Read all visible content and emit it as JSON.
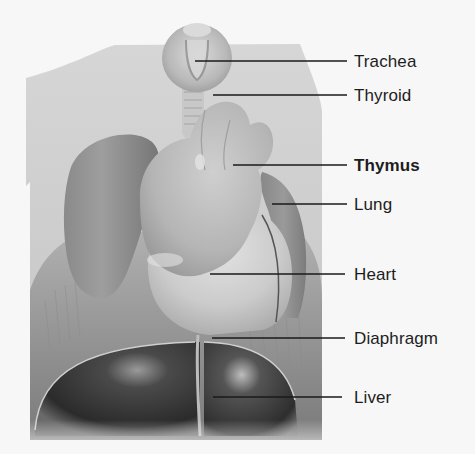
{
  "figure": {
    "highlighted_label": "Thymus",
    "labels": [
      {
        "id": "trachea",
        "text": "Trachea",
        "bold": false,
        "line": {
          "x1": 195,
          "x2": 347,
          "y": 61
        },
        "text_top": 52
      },
      {
        "id": "thyroid",
        "text": "Thyroid",
        "bold": false,
        "line": {
          "x1": 213,
          "x2": 347,
          "y": 95
        },
        "text_top": 86
      },
      {
        "id": "thymus",
        "text": "Thymus",
        "bold": true,
        "line": {
          "x1": 233,
          "x2": 347,
          "y": 165
        },
        "text_top": 156
      },
      {
        "id": "lung",
        "text": "Lung",
        "bold": false,
        "line": {
          "x1": 272,
          "x2": 347,
          "y": 204
        },
        "text_top": 195
      },
      {
        "id": "heart",
        "text": "Heart",
        "bold": false,
        "line": {
          "x1": 210,
          "x2": 345,
          "y": 274
        },
        "text_top": 265
      },
      {
        "id": "diaphragm",
        "text": "Diaphragm",
        "bold": false,
        "line": {
          "x1": 212,
          "x2": 345,
          "y": 338
        },
        "text_top": 329
      },
      {
        "id": "liver",
        "text": "Liver",
        "bold": false,
        "line": {
          "x1": 213,
          "x2": 342,
          "y": 397
        },
        "text_top": 388
      }
    ],
    "colors": {
      "background": "#f7f7f7",
      "label_text": "#1d1d1d",
      "leader_line": "#1a1a1a",
      "body_silhouette": "#c9c9c9",
      "organ_light": "#bdbdbd",
      "lung": "#8e8e8e",
      "liver": "#3a3a3a"
    }
  }
}
